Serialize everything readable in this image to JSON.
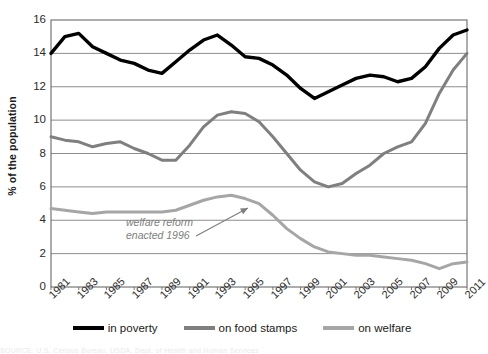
{
  "chart_data": {
    "type": "line",
    "title": "",
    "subtitle": "",
    "xlabel": "",
    "ylabel": "% of the population",
    "ylim": [
      0,
      16
    ],
    "yticks": [
      0,
      2,
      4,
      6,
      8,
      10,
      12,
      14,
      16
    ],
    "grid": true,
    "legend_position": "bottom",
    "x": [
      1981,
      1982,
      1983,
      1984,
      1985,
      1986,
      1987,
      1988,
      1989,
      1990,
      1991,
      1992,
      1993,
      1994,
      1995,
      1996,
      1997,
      1998,
      1999,
      2000,
      2001,
      2002,
      2003,
      2004,
      2005,
      2006,
      2007,
      2008,
      2009,
      2010,
      2011
    ],
    "xtick_labels": [
      "1981",
      "1983",
      "1985",
      "1987",
      "1989",
      "1991",
      "1993",
      "1995",
      "1997",
      "1999",
      "2001",
      "2003",
      "2005",
      "2007",
      "2009",
      "2011"
    ],
    "series": [
      {
        "name": "in poverty",
        "color": "#000000",
        "width": 3.4,
        "values": [
          14.0,
          15.0,
          15.2,
          14.4,
          14.0,
          13.6,
          13.4,
          13.0,
          12.8,
          13.5,
          14.2,
          14.8,
          15.1,
          14.5,
          13.8,
          13.7,
          13.3,
          12.7,
          11.9,
          11.3,
          11.7,
          12.1,
          12.5,
          12.7,
          12.6,
          12.3,
          12.5,
          13.2,
          14.3,
          15.1,
          15.4
        ]
      },
      {
        "name": "on food stamps",
        "color": "#7f7f7f",
        "width": 3.0,
        "values": [
          9.0,
          8.8,
          8.7,
          8.4,
          8.6,
          8.7,
          8.3,
          8.0,
          7.6,
          7.6,
          8.5,
          9.6,
          10.3,
          10.5,
          10.4,
          9.9,
          9.0,
          8.0,
          7.0,
          6.3,
          6.0,
          6.2,
          6.8,
          7.3,
          8.0,
          8.4,
          8.7,
          9.8,
          11.6,
          13.0,
          14.0
        ]
      },
      {
        "name": "on welfare",
        "color": "#a6a6a6",
        "width": 3.0,
        "values": [
          4.7,
          4.6,
          4.5,
          4.4,
          4.5,
          4.5,
          4.5,
          4.5,
          4.5,
          4.6,
          4.9,
          5.2,
          5.4,
          5.5,
          5.3,
          5.0,
          4.3,
          3.5,
          2.9,
          2.4,
          2.1,
          2.0,
          1.9,
          1.9,
          1.8,
          1.7,
          1.6,
          1.4,
          1.1,
          1.4,
          1.5
        ]
      }
    ],
    "annotations": [
      {
        "text": "welfare reform\nenacted 1996",
        "color": "#7d7d7d",
        "x_px": 126,
        "y_px": 216,
        "arrow": {
          "from_x": 196,
          "from_y": 236,
          "to_x": 248,
          "to_y": 208
        }
      }
    ]
  },
  "plot": {
    "left": 51,
    "top": 20,
    "right": 467,
    "bottom": 287,
    "border_color": "#6a6a6a",
    "grid_color": "#808080",
    "background": "#ffffff"
  },
  "caption": {
    "faint_text": "SOURCE: U.S. Census Bureau, USDA, Dept. of Health and Human Services"
  }
}
